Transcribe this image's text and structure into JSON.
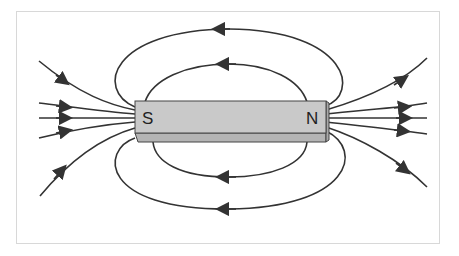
{
  "diagram": {
    "type": "bar-magnet-field-lines",
    "magnet": {
      "left_pole_label": "S",
      "right_pole_label": "N",
      "fill_color": "#c9c9c9",
      "side_color": "#b4b4b4",
      "outline_color": "#444444"
    },
    "field_lines": {
      "color": "#333333",
      "direction": "N to S outside magnet",
      "top_loops": 2,
      "bottom_loops": 2,
      "left_open_lines": 5,
      "right_open_lines": 5
    },
    "frame_border_color": "#d8d8d8"
  }
}
